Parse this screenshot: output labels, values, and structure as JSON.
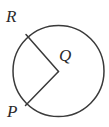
{
  "figure": {
    "kind": "circle-with-two-radii",
    "background_color": "#ffffff",
    "stroke_color": "#3a3a3a",
    "label_color": "#2b2b2b",
    "stroke_width": 1.5,
    "canvas": {
      "width": 109,
      "height": 127
    }
  },
  "circle": {
    "center_x": 58.5,
    "center_y": 71,
    "radius": 45.5,
    "fill": "none"
  },
  "radii": [
    {
      "name": "radius-QR",
      "from_label": "Q",
      "to_label": "R",
      "x1": 58.5,
      "y1": 71.5,
      "x2": 26.0,
      "y2": 34.5
    },
    {
      "name": "radius-QP",
      "from_label": "Q",
      "to_label": "P",
      "x1": 58.5,
      "y1": 71.5,
      "x2": 25.5,
      "y2": 105.5
    }
  ],
  "labels": [
    {
      "name": "point-label-R",
      "text": "R",
      "x": 6,
      "y": 22,
      "font_size": 17
    },
    {
      "name": "point-label-Q",
      "text": "Q",
      "x": 59,
      "y": 61,
      "font_size": 17
    },
    {
      "name": "point-label-P",
      "text": "P",
      "x": 7,
      "y": 117,
      "font_size": 17
    }
  ]
}
